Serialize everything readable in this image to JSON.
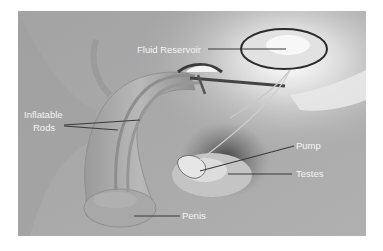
{
  "diagram": {
    "colors": {
      "background": "#ffffff",
      "panel": "#a9a9a9",
      "label_text": "#f4f4f4",
      "leader_line": "#3a3a3a",
      "reservoir_outline": "#2b2b2b"
    },
    "labels": {
      "fluid_reservoir": "Fluid Reservoir",
      "inflatable": "Inflatable",
      "rods": "Rods",
      "pump": "Pump",
      "testes": "Testes",
      "penis": "Penis"
    }
  }
}
